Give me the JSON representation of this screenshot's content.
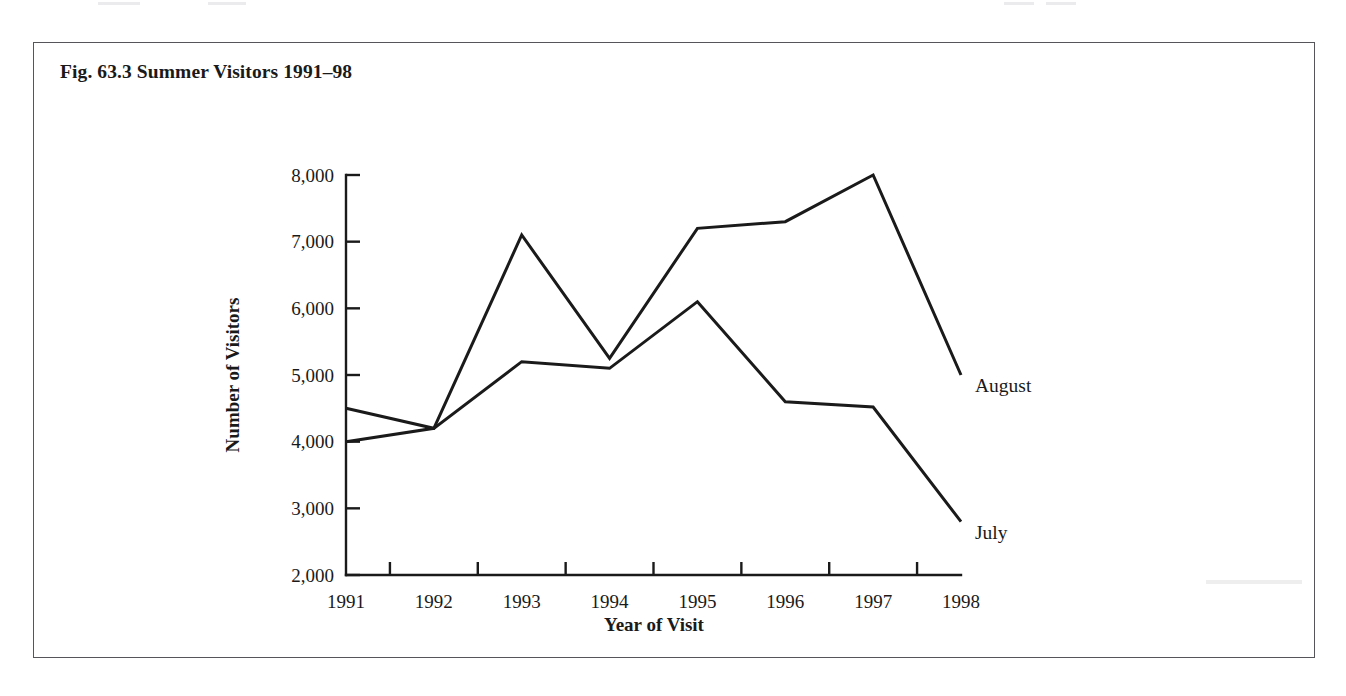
{
  "figure": {
    "title": "Fig. 63.3 Summer Visitors 1991–98"
  },
  "chart_data": {
    "type": "line",
    "title": "Fig. 63.3 Summer Visitors 1991–98",
    "xlabel": "Year of Visit",
    "ylabel": "Number of Visitors",
    "categories": [
      "1991",
      "1992",
      "1993",
      "1994",
      "1995",
      "1996",
      "1997",
      "1998"
    ],
    "x": [
      1991,
      1992,
      1993,
      1994,
      1995,
      1996,
      1997,
      1998
    ],
    "xlim": [
      1991,
      1998
    ],
    "ylim": [
      2000,
      8000
    ],
    "ytick_labels": [
      "8,000",
      "7,000",
      "6,000",
      "5,000",
      "4,000",
      "3,000",
      "2,000"
    ],
    "yticks": [
      8000,
      7000,
      6000,
      5000,
      4000,
      3000,
      2000
    ],
    "xtick_labels": [
      "1991",
      "1992",
      "1993",
      "1994",
      "1995",
      "1996",
      "1997",
      "1998"
    ],
    "grid": false,
    "legend": "inline-at-line-ends",
    "series": [
      {
        "name": "August",
        "values": [
          4000,
          4200,
          7100,
          5250,
          7200,
          7300,
          8000,
          5000
        ]
      },
      {
        "name": "July",
        "values": [
          4500,
          4200,
          5200,
          5100,
          6100,
          4600,
          4520,
          2800
        ]
      }
    ]
  }
}
